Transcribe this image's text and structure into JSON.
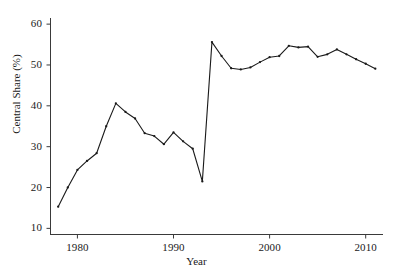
{
  "chart_data": {
    "type": "line",
    "title": "",
    "xlabel": "Year",
    "ylabel": "Central Share (%)",
    "xlim": [
      1977.2,
      2011.8
    ],
    "ylim": [
      8.5,
      61.5
    ],
    "xticks": [
      1980,
      1990,
      2000,
      2010
    ],
    "xticklabels": [
      "1980",
      "1990",
      "2000",
      "2010"
    ],
    "yticks": [
      10,
      20,
      30,
      40,
      50,
      60
    ],
    "yticklabels": [
      "10",
      "20",
      "30",
      "40",
      "50",
      "60"
    ],
    "grid": false,
    "legend": false,
    "legend_position": "none",
    "line_color": "#1a1a1a",
    "marker": "point",
    "x": [
      1978,
      1979,
      1980,
      1981,
      1982,
      1983,
      1984,
      1985,
      1986,
      1987,
      1988,
      1989,
      1990,
      1991,
      1992,
      1993,
      1994,
      1995,
      1996,
      1997,
      1998,
      1999,
      2000,
      2001,
      2002,
      2003,
      2004,
      2005,
      2006,
      2007,
      2008,
      2009,
      2010,
      2011
    ],
    "series": [
      {
        "name": "Central Share",
        "values": [
          15.3,
          20.0,
          24.3,
          26.5,
          28.4,
          35.0,
          40.6,
          38.5,
          36.9,
          33.3,
          32.6,
          30.6,
          33.5,
          31.3,
          29.5,
          21.5,
          55.6,
          52.2,
          49.2,
          48.9,
          49.4,
          50.7,
          51.9,
          52.2,
          54.7,
          54.3,
          54.5,
          52.0,
          52.6,
          53.8,
          52.6,
          51.4,
          50.3,
          49.1
        ]
      }
    ]
  },
  "axis": {
    "x_title": "Year",
    "y_title": "Central Share (%)"
  }
}
